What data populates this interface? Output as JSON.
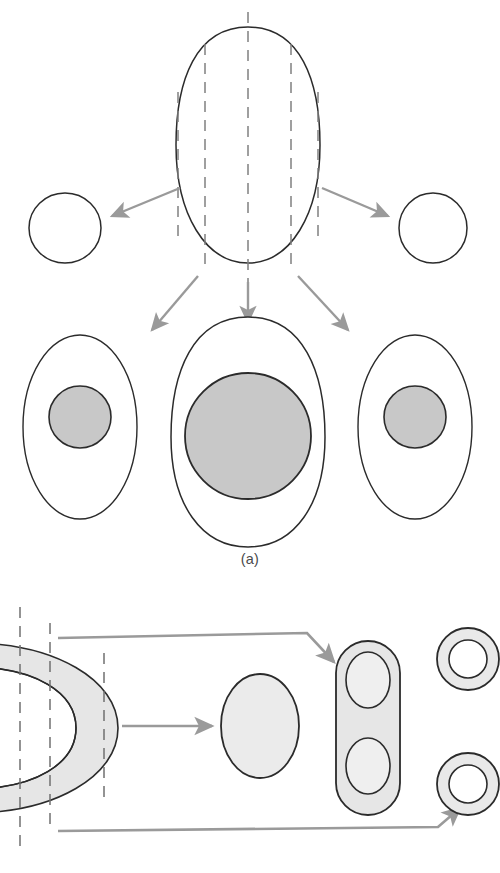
{
  "figure": {
    "background_color": "#ffffff",
    "outline_color": "#2b2b2b",
    "arrow_color": "#9a9a9a",
    "dash_color": "#808080",
    "nucleus_fill": "#c8c8c8",
    "body_fill": "#e9e9e9",
    "light_fill": "#efefef"
  },
  "panels": [
    {
      "id": "a",
      "caption": "(a)",
      "description": "Egg-shaped object sectioned by five vertical cutting planes, with resulting cross-sections shown below",
      "source_object": {
        "name": "egg-shape",
        "cx": 248,
        "cy": 145,
        "rx": 72,
        "ry": 118,
        "fill": "none"
      },
      "cut_lines": [
        {
          "id": "cut-1",
          "x": 178,
          "y1": 92,
          "y2": 240
        },
        {
          "id": "cut-2",
          "x": 205,
          "y1": 44,
          "y2": 268
        },
        {
          "id": "cut-3",
          "x": 248,
          "y1": 12,
          "y2": 300
        },
        {
          "id": "cut-4",
          "x": 291,
          "y1": 44,
          "y2": 268
        },
        {
          "id": "cut-5",
          "x": 318,
          "y1": 92,
          "y2": 240
        }
      ],
      "sections": [
        {
          "id": "section-far-left",
          "label": "empty outline ellipse",
          "cx": 65,
          "cy": 228,
          "rx": 36,
          "ry": 35,
          "nucleus": null
        },
        {
          "id": "section-far-right",
          "label": "empty outline ellipse",
          "cx": 433,
          "cy": 228,
          "rx": 34,
          "ry": 35,
          "nucleus": null
        },
        {
          "id": "section-left",
          "label": "small cell with nucleus",
          "cx": 80,
          "cy": 427,
          "rx": 57,
          "ry": 92,
          "nucleus": {
            "cx": 80,
            "cy": 417,
            "r": 31
          }
        },
        {
          "id": "section-center",
          "label": "large cell with nucleus",
          "cx": 248,
          "cy": 427,
          "rx": 77,
          "ry": 110,
          "nucleus": {
            "cx": 248,
            "cy": 436,
            "r": 63
          }
        },
        {
          "id": "section-right",
          "label": "small cell with nucleus",
          "cx": 415,
          "cy": 427,
          "rx": 57,
          "ry": 92,
          "nucleus": {
            "cx": 415,
            "cy": 417,
            "r": 31
          }
        }
      ],
      "arrows": [
        {
          "id": "arrow-a-far-left",
          "x1": 180,
          "y1": 188,
          "x2": 108,
          "y2": 218
        },
        {
          "id": "arrow-a-far-right",
          "x1": 322,
          "y1": 188,
          "x2": 392,
          "y2": 218
        },
        {
          "id": "arrow-a-left",
          "x1": 196,
          "y1": 278,
          "x2": 150,
          "y2": 332
        },
        {
          "id": "arrow-a-center",
          "x1": 248,
          "y1": 282,
          "x2": 248,
          "y2": 325
        },
        {
          "id": "arrow-a-right",
          "x1": 300,
          "y1": 278,
          "x2": 352,
          "y2": 332
        }
      ]
    },
    {
      "id": "b",
      "caption": "(b)",
      "description": "Horseshoe shaped solid sectioned by two vertical planes yielding an ellipse, a stadium with two cavities, and two annuli",
      "source_object": {
        "name": "horseshoe-shape",
        "opening": "left",
        "cx": 30,
        "cy": 143,
        "outer_r": 85,
        "inner_r": 38,
        "tube_half": 24
      },
      "cut_lines": [
        {
          "id": "cut-b-1",
          "x": 20,
          "y1": 22,
          "y2": 268
        },
        {
          "id": "cut-b-2",
          "x": 50,
          "y1": 38,
          "y2": 240
        },
        {
          "id": "cut-b-3",
          "x": 104,
          "y1": 68,
          "y2": 212
        }
      ],
      "sections": [
        {
          "id": "section-b-ellipse",
          "label": "solid ellipse cross-section",
          "cx": 260,
          "cy": 726,
          "rx": 39,
          "ry": 52
        },
        {
          "id": "section-b-stadium",
          "label": "stadium with two oval cavities",
          "cx": 368,
          "cy": 723,
          "rx": 32,
          "ry": 82,
          "cavities": [
            {
              "id": "cavity-upper",
              "cx": 368,
              "cy": 680,
              "rx": 22,
              "ry": 28
            },
            {
              "id": "cavity-lower",
              "cx": 368,
              "cy": 766,
              "rx": 22,
              "ry": 28
            }
          ]
        },
        {
          "id": "section-b-ring-upper",
          "label": "annulus cross-section",
          "cx": 468,
          "cy": 659,
          "outer_r": 31,
          "inner_r": 19
        },
        {
          "id": "section-b-ring-lower",
          "label": "annulus cross-section",
          "cx": 468,
          "cy": 784,
          "outer_r": 31,
          "inner_r": 19
        }
      ],
      "arrows": [
        {
          "id": "arrow-b-center",
          "type": "straight",
          "x1": 122,
          "y1": 726,
          "x2": 215,
          "y2": 726
        },
        {
          "id": "arrow-b-top",
          "type": "polyline",
          "points": "58,638 307,633 337,664"
        },
        {
          "id": "arrow-b-bottom",
          "type": "polyline",
          "points": "58,831 438,827 463,806"
        }
      ]
    }
  ]
}
